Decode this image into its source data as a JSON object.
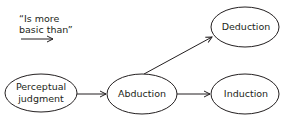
{
  "legend": {
    "line1": "“Is more",
    "line2": "basic than”",
    "arrow_icon": "right-arrow"
  },
  "nodes": {
    "perceptual_judgment": {
      "line1": "Perceptual",
      "line2": "judgment"
    },
    "abduction": {
      "label": "Abduction"
    },
    "deduction": {
      "label": "Deduction"
    },
    "induction": {
      "label": "Induction"
    }
  },
  "edges": [
    {
      "from": "Perceptual judgment",
      "to": "Abduction"
    },
    {
      "from": "Abduction",
      "to": "Deduction"
    },
    {
      "from": "Abduction",
      "to": "Induction"
    }
  ],
  "colors": {
    "stroke": "#231f20",
    "text": "#231f20",
    "background": "#ffffff"
  }
}
